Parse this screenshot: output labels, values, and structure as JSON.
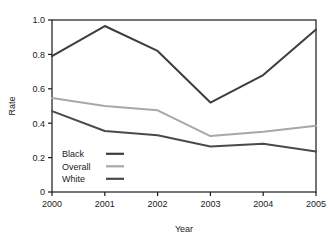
{
  "chart_data": {
    "type": "line",
    "title": "",
    "xlabel": "Year",
    "ylabel": "Rate",
    "categories": [
      "2000",
      "2001",
      "2002",
      "2003",
      "2004",
      "2005"
    ],
    "x": [
      2000,
      2001,
      2002,
      2003,
      2004,
      2005
    ],
    "xlim": [
      2000,
      2005
    ],
    "ylim": [
      0,
      1.0
    ],
    "yticks": [
      "0",
      "0.2",
      "0.4",
      "0.6",
      "0.8",
      "1.0"
    ],
    "ytick_values": [
      0,
      0.2,
      0.4,
      0.6,
      0.8,
      1.0
    ],
    "xticks": [
      "2000",
      "2001",
      "2002",
      "2003",
      "2004",
      "2005"
    ],
    "grid": false,
    "legend_position": "bottom-left",
    "series": [
      {
        "name": "Black",
        "color": "#3d3d3d",
        "values": [
          0.79,
          0.965,
          0.82,
          0.52,
          0.68,
          0.945
        ]
      },
      {
        "name": "Overall",
        "color": "#a8a8a8",
        "values": [
          0.547,
          0.5,
          0.475,
          0.325,
          0.35,
          0.385
        ]
      },
      {
        "name": "White",
        "color": "#4a4a4a",
        "values": [
          0.47,
          0.355,
          0.33,
          0.265,
          0.28,
          0.235
        ]
      }
    ]
  },
  "axes": {
    "y_title": "Rate",
    "x_title": "Year",
    "frame_color": "#1a1a1a"
  },
  "legend": {
    "entries": [
      {
        "label": "Black",
        "color": "#3d3d3d"
      },
      {
        "label": "Overall",
        "color": "#a8a8a8"
      },
      {
        "label": "White",
        "color": "#4a4a4a"
      }
    ]
  }
}
